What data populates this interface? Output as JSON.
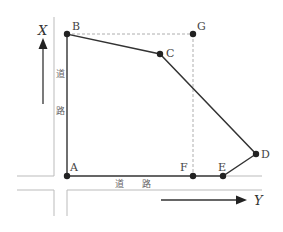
{
  "diagram": {
    "type": "land-survey plot",
    "axes": {
      "x_label": "X",
      "y_label": "Y"
    },
    "road_labels": {
      "vertical": [
        "道",
        "路"
      ],
      "horizontal": [
        "道",
        "路"
      ]
    },
    "points": [
      {
        "name": "A",
        "x": 67,
        "y": 176
      },
      {
        "name": "B",
        "x": 67,
        "y": 34
      },
      {
        "name": "C",
        "x": 160,
        "y": 54
      },
      {
        "name": "D",
        "x": 256,
        "y": 154
      },
      {
        "name": "E",
        "x": 223,
        "y": 176
      },
      {
        "name": "F",
        "x": 193,
        "y": 176
      },
      {
        "name": "G",
        "x": 193,
        "y": 34
      }
    ],
    "polygon": [
      "A",
      "B",
      "C",
      "D",
      "E",
      "F",
      "A"
    ],
    "dashed_lines": [
      [
        "B",
        "G"
      ],
      [
        "G",
        "F"
      ]
    ],
    "colors": {
      "line": "#333333",
      "road": "#bbbbbb",
      "dashed": "#999999",
      "point": "#222222"
    }
  }
}
